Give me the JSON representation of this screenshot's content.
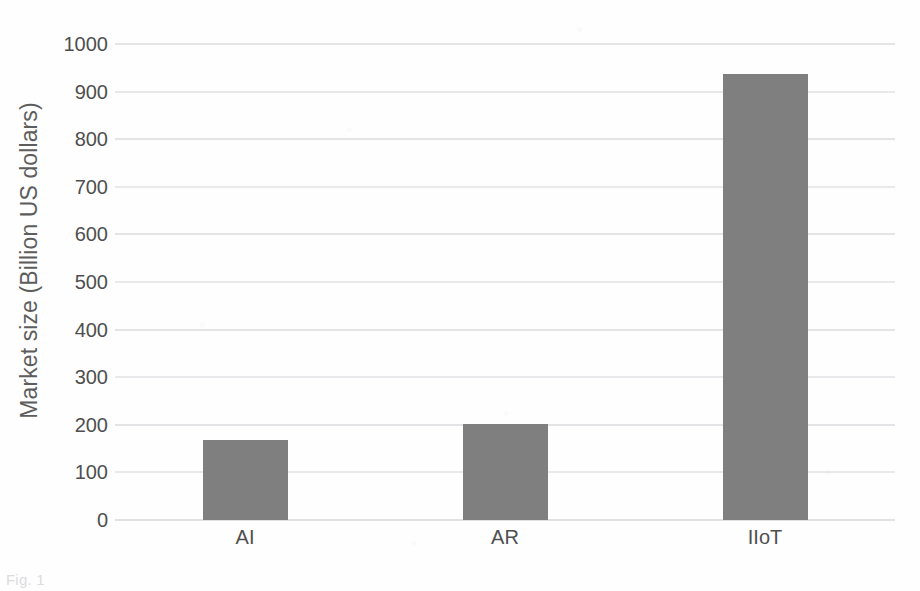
{
  "chart_data": {
    "type": "bar",
    "title": "",
    "subtitle": "",
    "xlabel": "",
    "ylabel": "Market size (Billion US dollars)",
    "categories": [
      "AI",
      "AR",
      "IIoT"
    ],
    "values": [
      168,
      202,
      938
    ],
    "series": [
      {
        "name": "Market size",
        "values": [
          168,
          202,
          938
        ]
      }
    ],
    "ylim": [
      0,
      1000
    ],
    "ytick_labels": [
      "1000",
      "900",
      "800",
      "700",
      "600",
      "500",
      "400",
      "300",
      "200",
      "100",
      "0"
    ],
    "ytick_values": [
      1000,
      900,
      800,
      700,
      600,
      500,
      400,
      300,
      200,
      100,
      0
    ],
    "ytick_step": 100,
    "grid": "horizontal",
    "legend": "none",
    "bar_color": "#7f7f7f",
    "gridline_color": "#cfcfd2",
    "background_color": "#ffffff",
    "text_color": "#4f4f4f",
    "annotations": []
  },
  "caption": {
    "partial_text": "Fig. 1"
  }
}
